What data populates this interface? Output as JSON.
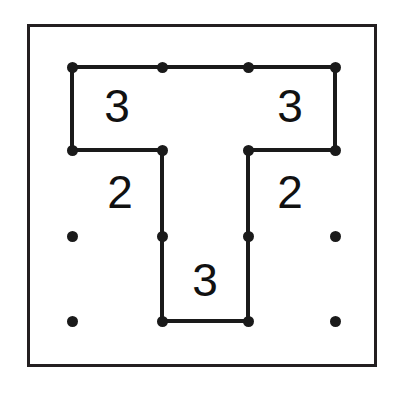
{
  "puzzle": {
    "name": "slitherlink-puzzle",
    "type": "slitherlink",
    "rows": 3,
    "cols": 3,
    "colors": {
      "ink": "#1a1a1a",
      "frame": "#231f20",
      "paper": "#ffffff",
      "clue_text": "#111111"
    },
    "frame": {
      "x": 27,
      "y": 24,
      "width": 350,
      "height": 343,
      "stroke_width": 3
    },
    "lattice": {
      "dot_x": [
        72,
        162,
        248,
        335
      ],
      "dot_y": [
        67,
        150,
        236,
        321
      ],
      "dot_radius": 5.5
    },
    "dots": [
      {
        "id": "dot-r0-c0",
        "row": 0,
        "col": 0,
        "x": 72,
        "y": 67
      },
      {
        "id": "dot-r0-c1",
        "row": 0,
        "col": 1,
        "x": 162,
        "y": 67
      },
      {
        "id": "dot-r0-c2",
        "row": 0,
        "col": 2,
        "x": 248,
        "y": 67
      },
      {
        "id": "dot-r0-c3",
        "row": 0,
        "col": 3,
        "x": 335,
        "y": 67
      },
      {
        "id": "dot-r1-c0",
        "row": 1,
        "col": 0,
        "x": 72,
        "y": 150
      },
      {
        "id": "dot-r1-c1",
        "row": 1,
        "col": 1,
        "x": 162,
        "y": 150
      },
      {
        "id": "dot-r1-c2",
        "row": 1,
        "col": 2,
        "x": 248,
        "y": 150
      },
      {
        "id": "dot-r1-c3",
        "row": 1,
        "col": 3,
        "x": 335,
        "y": 150
      },
      {
        "id": "dot-r2-c0",
        "row": 2,
        "col": 0,
        "x": 72,
        "y": 236
      },
      {
        "id": "dot-r2-c1",
        "row": 2,
        "col": 1,
        "x": 162,
        "y": 236
      },
      {
        "id": "dot-r2-c2",
        "row": 2,
        "col": 2,
        "x": 248,
        "y": 236
      },
      {
        "id": "dot-r2-c3",
        "row": 2,
        "col": 3,
        "x": 335,
        "y": 236
      },
      {
        "id": "dot-r3-c0",
        "row": 3,
        "col": 0,
        "x": 72,
        "y": 321
      },
      {
        "id": "dot-r3-c1",
        "row": 3,
        "col": 1,
        "x": 162,
        "y": 321
      },
      {
        "id": "dot-r3-c2",
        "row": 3,
        "col": 2,
        "x": 248,
        "y": 321
      },
      {
        "id": "dot-r3-c3",
        "row": 3,
        "col": 3,
        "x": 335,
        "y": 321
      }
    ],
    "edges": [
      {
        "id": "edge-h-r0-c0",
        "orientation": "horizontal",
        "row": 0,
        "col": 0,
        "x": 72,
        "y": 67,
        "length": 90,
        "drawn": true
      },
      {
        "id": "edge-h-r0-c1",
        "orientation": "horizontal",
        "row": 0,
        "col": 1,
        "x": 162,
        "y": 67,
        "length": 86,
        "drawn": true
      },
      {
        "id": "edge-h-r0-c2",
        "orientation": "horizontal",
        "row": 0,
        "col": 2,
        "x": 248,
        "y": 67,
        "length": 87,
        "drawn": true
      },
      {
        "id": "edge-h-r1-c0",
        "orientation": "horizontal",
        "row": 1,
        "col": 0,
        "x": 72,
        "y": 150,
        "length": 90,
        "drawn": true
      },
      {
        "id": "edge-h-r1-c2",
        "orientation": "horizontal",
        "row": 1,
        "col": 2,
        "x": 248,
        "y": 150,
        "length": 87,
        "drawn": true
      },
      {
        "id": "edge-h-r3-c1",
        "orientation": "horizontal",
        "row": 3,
        "col": 1,
        "x": 162,
        "y": 321,
        "length": 86,
        "drawn": true
      },
      {
        "id": "edge-v-r0-c0",
        "orientation": "vertical",
        "row": 0,
        "col": 0,
        "x": 72,
        "y": 67,
        "length": 83,
        "drawn": true
      },
      {
        "id": "edge-v-r0-c3",
        "orientation": "vertical",
        "row": 0,
        "col": 3,
        "x": 335,
        "y": 67,
        "length": 83,
        "drawn": true
      },
      {
        "id": "edge-v-r1-c1",
        "orientation": "vertical",
        "row": 1,
        "col": 1,
        "x": 162,
        "y": 150,
        "length": 86,
        "drawn": true
      },
      {
        "id": "edge-v-r1-c2",
        "orientation": "vertical",
        "row": 1,
        "col": 2,
        "x": 248,
        "y": 150,
        "length": 86,
        "drawn": true
      },
      {
        "id": "edge-v-r2-c1",
        "orientation": "vertical",
        "row": 2,
        "col": 1,
        "x": 162,
        "y": 236,
        "length": 85,
        "drawn": true
      },
      {
        "id": "edge-v-r2-c2",
        "orientation": "vertical",
        "row": 2,
        "col": 2,
        "x": 248,
        "y": 236,
        "length": 85,
        "drawn": true
      }
    ],
    "clues": [
      {
        "id": "clue-r0-c0",
        "row": 0,
        "col": 0,
        "value": "3",
        "x": 117,
        "y": 106
      },
      {
        "id": "clue-r0-c2",
        "row": 0,
        "col": 2,
        "value": "3",
        "x": 290,
        "y": 106
      },
      {
        "id": "clue-r1-c0",
        "row": 1,
        "col": 0,
        "value": "2",
        "x": 120,
        "y": 192
      },
      {
        "id": "clue-r1-c2",
        "row": 1,
        "col": 2,
        "value": "2",
        "x": 290,
        "y": 192
      },
      {
        "id": "clue-r2-c1",
        "row": 2,
        "col": 1,
        "value": "3",
        "x": 205,
        "y": 280
      }
    ]
  }
}
